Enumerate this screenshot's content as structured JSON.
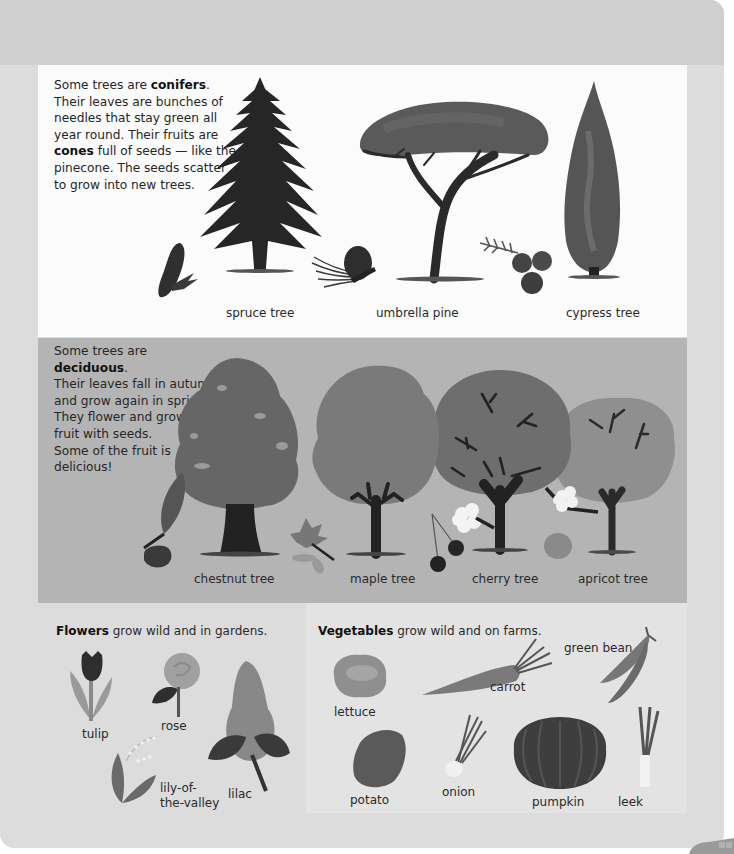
{
  "conifers": {
    "intro_prefix": "Some trees are ",
    "intro_bold": "conifers",
    "intro_suffix": ".",
    "lines": [
      "Their leaves are bunches of",
      "needles that stay green all",
      "year round. Their fruits are"
    ],
    "cones_bold": "cones",
    "cones_rest": " full of seeds — like the",
    "lines_after": [
      "pinecone. The seeds scatter",
      "to grow into new trees."
    ],
    "trees": [
      {
        "label": "spruce tree",
        "icon": "spruce-tree-icon"
      },
      {
        "label": "umbrella pine",
        "icon": "umbrella-pine-icon"
      },
      {
        "label": "cypress tree",
        "icon": "cypress-tree-icon"
      }
    ]
  },
  "deciduous": {
    "intro_prefix": "Some trees are ",
    "intro_bold": "deciduous",
    "intro_suffix": ".",
    "lines": [
      "Their leaves fall in autumn",
      "and grow again in spring.",
      "They flower and grow",
      "fruit with seeds.",
      "Some of the fruit is",
      "delicious!"
    ],
    "trees": [
      {
        "label": "chestnut tree",
        "icon": "chestnut-tree-icon"
      },
      {
        "label": "maple tree",
        "icon": "maple-tree-icon"
      },
      {
        "label": "cherry tree",
        "icon": "cherry-tree-icon"
      },
      {
        "label": "apricot tree",
        "icon": "apricot-tree-icon"
      }
    ]
  },
  "flowers": {
    "heading_bold": "Flowers",
    "heading_rest": " grow wild and in gardens.",
    "items": [
      {
        "label": "tulip"
      },
      {
        "label": "rose"
      },
      {
        "label_line1": "lily-of-",
        "label_line2": "the-valley"
      },
      {
        "label": "lilac"
      }
    ]
  },
  "vegetables": {
    "heading_bold": "Vegetables",
    "heading_rest": " grow wild and on farms.",
    "items": [
      {
        "label": "lettuce"
      },
      {
        "label": "carrot"
      },
      {
        "label": "green bean"
      },
      {
        "label": "potato"
      },
      {
        "label": "onion"
      },
      {
        "label": "pumpkin"
      },
      {
        "label": "leek"
      }
    ]
  },
  "colors": {
    "page_bg": "#dcdcdc",
    "conifer_panel_bg": "#fbfbfb",
    "deciduous_panel_bg": "#b4b4b4",
    "veg_panel_bg": "#e3e3e3",
    "text": "#262626"
  }
}
